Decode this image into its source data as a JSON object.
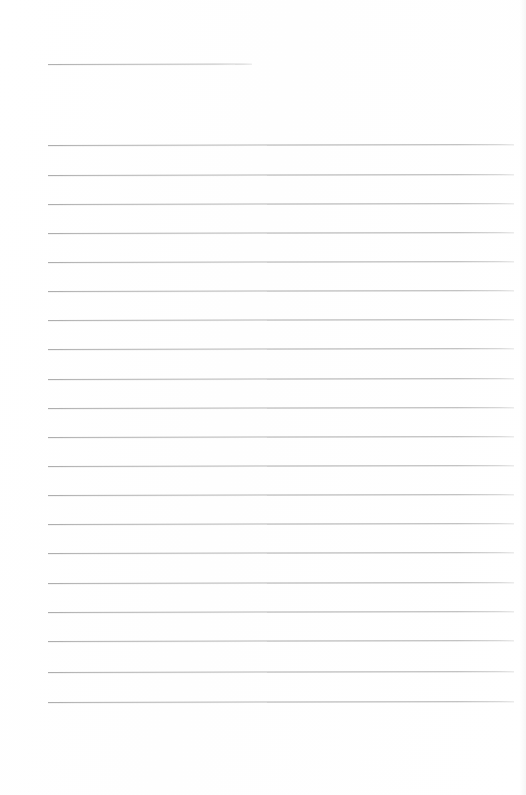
{
  "document": {
    "kind": "scanned-blank-ruled-page",
    "title": "",
    "body_text": "",
    "background_color": "#ffffff",
    "rule_color": "#b4b4b4",
    "page_width": 526,
    "page_height": 795
  },
  "header_rule": {
    "name": "header-underline-rule",
    "x": 48,
    "y": 64,
    "width": 204,
    "label": ""
  },
  "ruled_lines": {
    "count": 20,
    "left_x": 48,
    "right_x": 514,
    "first_y": 145,
    "spacing": 29.2,
    "items": [
      {
        "index": 1,
        "y": 145,
        "text": ""
      },
      {
        "index": 2,
        "y": 175,
        "text": ""
      },
      {
        "index": 3,
        "y": 204,
        "text": ""
      },
      {
        "index": 4,
        "y": 233,
        "text": ""
      },
      {
        "index": 5,
        "y": 262,
        "text": ""
      },
      {
        "index": 6,
        "y": 291,
        "text": ""
      },
      {
        "index": 7,
        "y": 320,
        "text": ""
      },
      {
        "index": 8,
        "y": 349,
        "text": ""
      },
      {
        "index": 9,
        "y": 379,
        "text": ""
      },
      {
        "index": 10,
        "y": 408,
        "text": ""
      },
      {
        "index": 11,
        "y": 437,
        "text": ""
      },
      {
        "index": 12,
        "y": 466,
        "text": ""
      },
      {
        "index": 13,
        "y": 495,
        "text": ""
      },
      {
        "index": 14,
        "y": 524,
        "text": ""
      },
      {
        "index": 15,
        "y": 553,
        "text": ""
      },
      {
        "index": 16,
        "y": 583,
        "text": ""
      },
      {
        "index": 17,
        "y": 612,
        "text": ""
      },
      {
        "index": 18,
        "y": 641,
        "text": ""
      },
      {
        "index": 19,
        "y": 672,
        "text": ""
      },
      {
        "index": 20,
        "y": 702,
        "text": ""
      }
    ]
  },
  "footer": {
    "margin_top": 731,
    "text": ""
  }
}
